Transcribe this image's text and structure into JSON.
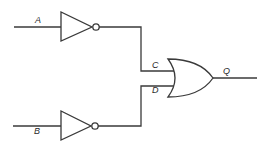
{
  "diagram": {
    "type": "logic-circuit",
    "labels": {
      "input_a": "A",
      "input_b": "B",
      "node_c": "C",
      "node_d": "D",
      "output_q": "Q"
    },
    "components": [
      {
        "id": "not-a",
        "kind": "NOT",
        "input": "A",
        "output": "C"
      },
      {
        "id": "not-b",
        "kind": "NOT",
        "input": "B",
        "output": "D"
      },
      {
        "id": "or-1",
        "kind": "OR",
        "inputs": [
          "C",
          "D"
        ],
        "output": "Q"
      }
    ],
    "colors": {
      "line": "#3a3a3a",
      "background": "#ffffff"
    }
  }
}
